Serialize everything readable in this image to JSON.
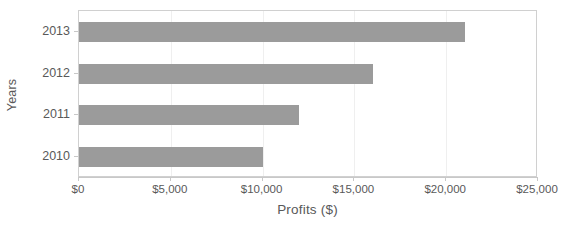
{
  "chart_data": {
    "type": "bar",
    "orientation": "horizontal",
    "title": "",
    "xlabel": "Profits ($)",
    "ylabel": "Years",
    "categories": [
      "2010",
      "2011",
      "2012",
      "2013"
    ],
    "values": [
      10000,
      12000,
      16000,
      21000
    ],
    "xlim": [
      0,
      25000
    ],
    "xticks": [
      0,
      5000,
      10000,
      15000,
      20000,
      25000
    ],
    "xtick_labels": [
      "$0",
      "$5,000",
      "$10,000",
      "$15,000",
      "$20,000",
      "$25,000"
    ],
    "ytick_labels": [
      "2013",
      "2012",
      "2011",
      "2010"
    ],
    "grid": true,
    "legend": false,
    "bar_color": "#9b9b9b",
    "axis_color": "#c8c8c8",
    "text_color": "#595959",
    "plot_background": "#ffffff"
  }
}
